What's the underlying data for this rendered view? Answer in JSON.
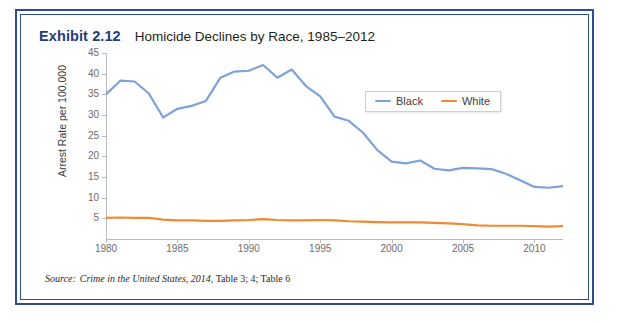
{
  "exhibit": {
    "label": "Exhibit 2.12",
    "title": "Homicide Declines by Race, 1985–2012",
    "source_prefix": "Source:",
    "source_italic": "Crime in the United States, 2014",
    "source_rest": ", Table 3; 4; Table 6",
    "border_color": "#2d4d8e"
  },
  "legend": {
    "position": "top-right",
    "entries": [
      {
        "label": "Black",
        "color": "#7ea1d8"
      },
      {
        "label": "White",
        "color": "#ed8b33"
      }
    ]
  },
  "chart_data": {
    "type": "line",
    "title": "Homicide Declines by Race, 1985–2012",
    "xlabel": "",
    "ylabel": "Arrest Rate per 100,000",
    "xlim": [
      1980,
      2012
    ],
    "ylim": [
      0,
      45
    ],
    "grid": false,
    "x_ticks": [
      1980,
      1985,
      1990,
      1995,
      2000,
      2005,
      2010
    ],
    "y_ticks": [
      5,
      10,
      15,
      20,
      25,
      30,
      35,
      40,
      45
    ],
    "x": [
      1980,
      1981,
      1982,
      1983,
      1984,
      1985,
      1986,
      1987,
      1988,
      1989,
      1990,
      1991,
      1992,
      1993,
      1994,
      1995,
      1996,
      1997,
      1998,
      1999,
      2000,
      2001,
      2002,
      2003,
      2004,
      2005,
      2006,
      2007,
      2008,
      2009,
      2010,
      2011,
      2012
    ],
    "series": [
      {
        "name": "Black",
        "color": "#7ea1d8",
        "values": [
          35.0,
          38.3,
          38.1,
          35.2,
          29.4,
          31.5,
          32.2,
          33.4,
          39.0,
          40.5,
          40.7,
          42.1,
          39.0,
          41.0,
          37.0,
          34.5,
          29.6,
          28.6,
          25.7,
          21.5,
          18.7,
          18.3,
          19.0,
          17.0,
          16.6,
          17.2,
          17.1,
          16.9,
          15.8,
          14.2,
          12.6,
          12.4,
          12.8
        ]
      },
      {
        "name": "White",
        "color": "#ed8b33",
        "values": [
          5.1,
          5.2,
          5.1,
          5.1,
          4.7,
          4.5,
          4.5,
          4.4,
          4.4,
          4.5,
          4.6,
          4.8,
          4.6,
          4.5,
          4.5,
          4.6,
          4.5,
          4.3,
          4.2,
          4.1,
          4.0,
          4.0,
          4.0,
          3.9,
          3.8,
          3.6,
          3.3,
          3.2,
          3.2,
          3.2,
          3.1,
          3.0,
          3.1
        ]
      }
    ]
  }
}
